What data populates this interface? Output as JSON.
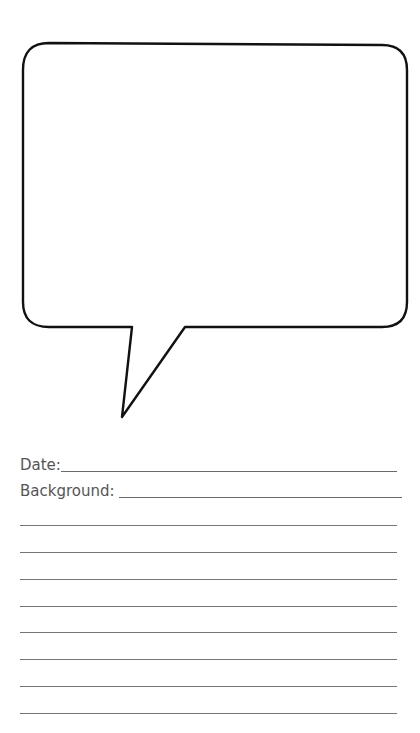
{
  "worksheet": {
    "speech_bubble": {
      "shape": "rounded-rectangle-with-tail",
      "stroke_color": "#111111",
      "fill_color": "#ffffff",
      "content": ""
    },
    "fields": [
      {
        "label": "Date:",
        "value": ""
      },
      {
        "label": "Background: ",
        "value": ""
      }
    ],
    "ruled_lines_count": 8,
    "ruled_lines": [
      "",
      "",
      "",
      "",
      "",
      "",
      "",
      ""
    ]
  }
}
